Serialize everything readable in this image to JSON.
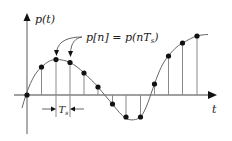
{
  "labels": {
    "y_axis": "p(t)",
    "x_axis": "t",
    "sample_eq": "p[n] = p(nT",
    "sample_eq_sub": "s",
    "sample_eq_close": ")",
    "period": "T",
    "period_sub": "s"
  },
  "colors": {
    "axis": "#808080",
    "dot": "#111111",
    "curve": "#666666"
  },
  "geometry": {
    "origin": [
      27,
      95
    ],
    "sample_spacing_px": 14,
    "samples": [
      {
        "n": 0,
        "x": 27,
        "y": 95
      },
      {
        "n": 1,
        "x": 41.5,
        "y": 67
      },
      {
        "n": 2,
        "x": 56,
        "y": 59.5
      },
      {
        "n": 3,
        "x": 70,
        "y": 62.5
      },
      {
        "n": 4,
        "x": 84,
        "y": 73
      },
      {
        "n": 5,
        "x": 98,
        "y": 87
      },
      {
        "n": 6,
        "x": 112.5,
        "y": 104
      },
      {
        "n": 7,
        "x": 126,
        "y": 117
      },
      {
        "n": 8,
        "x": 140.5,
        "y": 117
      },
      {
        "n": 9,
        "x": 154.5,
        "y": 84
      },
      {
        "n": 10,
        "x": 168.5,
        "y": 56
      },
      {
        "n": 11,
        "x": 182.5,
        "y": 43
      },
      {
        "n": 12,
        "x": 197,
        "y": 36
      }
    ]
  }
}
